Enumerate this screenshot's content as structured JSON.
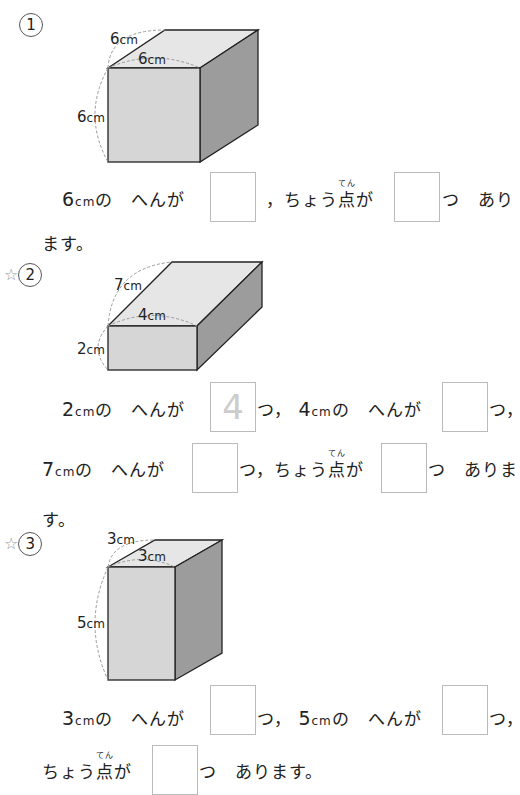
{
  "problems": [
    {
      "label": "1",
      "starred": false,
      "figure": {
        "labels": [
          "6",
          "6",
          "6"
        ],
        "unit": "cm"
      },
      "sentence": {
        "part1_prefix": "6",
        "unit": "cm",
        "part1_text": "の　へんが",
        "comma": "，",
        "vertex_text": "ちょう",
        "vertex_kanji": "点",
        "vertex_ruby": "てん",
        "vertex_suffix": "が",
        "tsu": "つ",
        "ending1": "あり",
        "ending2": "ます。"
      },
      "answers": [
        "",
        ""
      ]
    },
    {
      "label": "2",
      "starred": true,
      "figure": {
        "labels": [
          "7",
          "4",
          "2"
        ],
        "unit": "cm"
      },
      "sentence": {
        "a_num": "2",
        "b_num": "4",
        "c_num": "7",
        "unit": "cm",
        "edge_text": "の　へんが",
        "tsu_comma": "つ，",
        "vertex_text": "ちょう",
        "vertex_kanji": "点",
        "vertex_ruby": "てん",
        "vertex_suffix": "が",
        "tsu": "つ",
        "ending1": "ありま",
        "ending2": "す。"
      },
      "answers": [
        "4",
        "",
        "",
        ""
      ]
    },
    {
      "label": "3",
      "starred": true,
      "figure": {
        "labels": [
          "3",
          "3",
          "5"
        ],
        "unit": "cm"
      },
      "sentence": {
        "a_num": "3",
        "b_num": "5",
        "unit": "cm",
        "edge_text": "の　へんが",
        "tsu_comma": "つ，",
        "vertex_text": "ちょう",
        "vertex_kanji": "点",
        "vertex_ruby": "てん",
        "vertex_suffix": "が",
        "ending": "つ　あります。"
      },
      "answers": [
        "",
        "",
        ""
      ]
    }
  ],
  "symbols": {
    "star": "☆"
  }
}
